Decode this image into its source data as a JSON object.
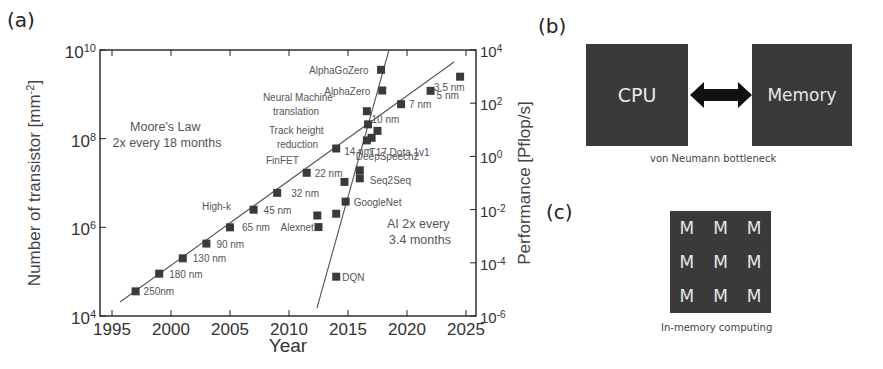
{
  "panels": {
    "a": {
      "label": "(a)"
    },
    "b": {
      "label": "(b)",
      "left_box": "CPU",
      "right_box": "Memory",
      "caption": "von Neumann bottleneck"
    },
    "c": {
      "label": "(c)",
      "cells": [
        "M",
        "M",
        "M",
        "M",
        "M",
        "M",
        "M",
        "M",
        "M"
      ],
      "caption": "In-memory computing"
    }
  },
  "chart_data": {
    "type": "scatter",
    "title": "",
    "xlabel": "Year",
    "ylabel": "Number of transistor [mm^-2]",
    "y2label": "Performance [Pflop/s]",
    "xlim": [
      1994.3,
      2026
    ],
    "ylim": [
      10000,
      10000000000
    ],
    "y2lim": [
      1e-06,
      10000
    ],
    "yscale": "log",
    "y2scale": "log",
    "grid": false,
    "x_ticks": [
      "1995",
      "2000",
      "2005",
      "2010",
      "2015",
      "2020",
      "2025"
    ],
    "y_ticks": [
      {
        "base": "10",
        "exp": "4"
      },
      {
        "base": "10",
        "exp": "6"
      },
      {
        "base": "10",
        "exp": "8"
      },
      {
        "base": "10",
        "exp": "10"
      }
    ],
    "y2_ticks": [
      {
        "base": "10",
        "exp": "-6"
      },
      {
        "base": "10",
        "exp": "-4"
      },
      {
        "base": "10",
        "exp": "-2"
      },
      {
        "base": "10",
        "exp": "0"
      },
      {
        "base": "10",
        "exp": "2"
      },
      {
        "base": "10",
        "exp": "4"
      }
    ],
    "annotations": [
      {
        "text": "Moore's Law",
        "line2": "2x every 18 months"
      },
      {
        "text": "AI 2x every",
        "line2": "3.4 months"
      },
      {
        "text": "High-k"
      },
      {
        "text": "FinFET"
      }
    ],
    "series": [
      {
        "name": "Moore's Law (transistor density, left axis)",
        "axis": "left",
        "trend": "2x every 18 months",
        "points": [
          {
            "x": 1997,
            "y": 36000,
            "label": "250nm"
          },
          {
            "x": 1999,
            "y": 90000,
            "label": "180 nm"
          },
          {
            "x": 2001,
            "y": 200000,
            "label": "130 nm"
          },
          {
            "x": 2003,
            "y": 430000,
            "label": "90 nm"
          },
          {
            "x": 2005,
            "y": 1000000,
            "label": "65 nm"
          },
          {
            "x": 2007,
            "y": 2500000,
            "label": "45 nm"
          },
          {
            "x": 2009,
            "y": 6000000,
            "label": "32 nm"
          },
          {
            "x": 2011.5,
            "y": 17000000,
            "label": "22 nm"
          },
          {
            "x": 2014,
            "y": 60000000,
            "label": "14 nm"
          },
          {
            "x": 2017.5,
            "y": 150000000,
            "label": "10 nm"
          },
          {
            "x": 2019.5,
            "y": 600000000,
            "label": "7 nm"
          },
          {
            "x": 2022,
            "y": 1200000000,
            "label": "5 nm"
          },
          {
            "x": 2024.5,
            "y": 2500000000,
            "label": "3.5 nm"
          }
        ]
      },
      {
        "name": "AI compute (Pflop/s, right axis)",
        "axis": "right",
        "trend": "2x every 3.4 months",
        "points": [
          {
            "x": 2014,
            "y": 3e-05,
            "label": "DQN"
          },
          {
            "x": 2012.5,
            "y": 0.0022,
            "label": "Alexnet"
          },
          {
            "x": 2012.4,
            "y": 0.006,
            "label": ""
          },
          {
            "x": 2014,
            "y": 0.007,
            "label": ""
          },
          {
            "x": 2014.8,
            "y": 0.02,
            "label": "GoogleNet"
          },
          {
            "x": 2014.7,
            "y": 0.11,
            "label": ""
          },
          {
            "x": 2016,
            "y": 0.15,
            "label": "Seq2Seq"
          },
          {
            "x": 2016,
            "y": 0.3,
            "label": "DeepSpeech2"
          },
          {
            "x": 2017,
            "y": 5,
            "label": "T17 Dota 1v1"
          },
          {
            "x": 2016.6,
            "y": 4,
            "label": "Track height reduction"
          },
          {
            "x": 2016.7,
            "y": 16,
            "label": ""
          },
          {
            "x": 2016.6,
            "y": 50,
            "label": "Neural Machine translation"
          },
          {
            "x": 2017.9,
            "y": 300,
            "label": "AlphaZero"
          },
          {
            "x": 2017.8,
            "y": 1800,
            "label": "AlphaGoZero"
          }
        ]
      }
    ]
  }
}
